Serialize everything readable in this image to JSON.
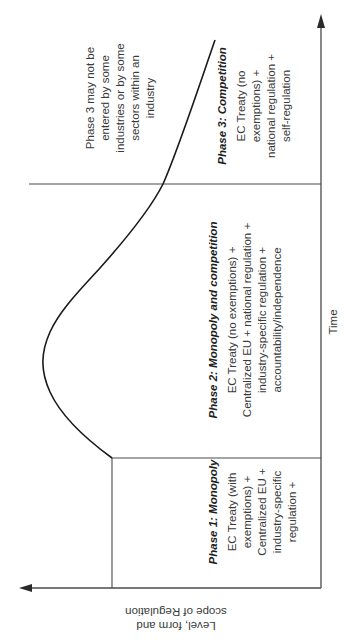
{
  "diagram": {
    "x_axis_label": "Time",
    "y_axis_label": [
      "Level, form and",
      "scope of Regulation"
    ],
    "curve_description": "Level of regulation over time: starts at Phase 1 level, rises to a peak in Phase 2, falls in Phase 3",
    "phases": [
      {
        "title": "Phase 1: Monopoly",
        "lines": [
          "EC Treaty (with",
          "exemptions) +",
          "Centralized EU +",
          "industry-specific",
          "regulation +",
          "public-ownership"
        ]
      },
      {
        "title": "Phase 2: Monopoly and competition",
        "lines": [
          "EC Treaty (no exemptions) +",
          "Centralized EU + national regulation +",
          "industry-specific regulation +",
          "accountability/independence"
        ]
      },
      {
        "title": "Phase 3: Competition",
        "lines": [
          "EC Treaty (no",
          "exemptions) +",
          "national regulation +",
          "self-regulation"
        ]
      }
    ],
    "note": {
      "lines": [
        "Phase 3 may not be",
        "entered by some",
        "industries or by some",
        "sectors within an",
        "industry"
      ]
    },
    "colors": {
      "axis": "#4a4a4a",
      "curve": "#1a1a1a",
      "text": "#3a3a3a",
      "background": "#ffffff"
    }
  }
}
